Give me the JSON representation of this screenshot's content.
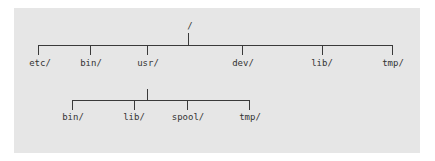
{
  "diagram": {
    "type": "tree",
    "colors": {
      "panel_background": "#e6e6e6",
      "line": "#3a3a3a",
      "text": "#333333"
    },
    "root": {
      "label": "/",
      "children": [
        {
          "label": "etc/"
        },
        {
          "label": "bin/"
        },
        {
          "label": "usr/",
          "children": [
            {
              "label": "bin/"
            },
            {
              "label": "lib/"
            },
            {
              "label": "spool/"
            },
            {
              "label": "tmp/"
            }
          ]
        },
        {
          "label": "dev/"
        },
        {
          "label": "lib/"
        },
        {
          "label": "tmp/"
        }
      ]
    }
  }
}
